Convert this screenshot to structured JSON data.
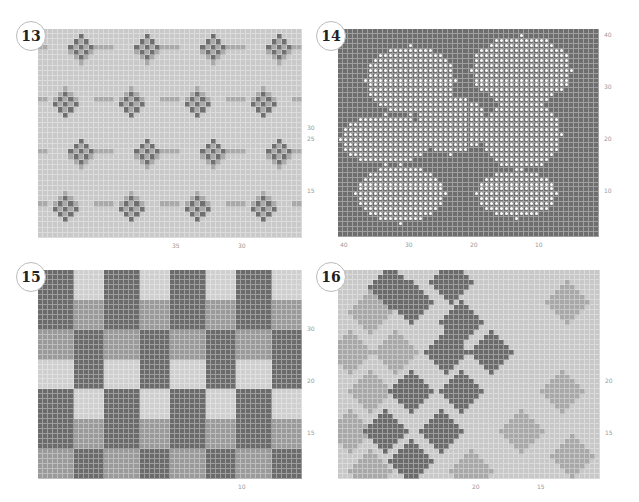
{
  "panels": [
    {
      "id": "13",
      "x": 38,
      "y": 29,
      "w": 264,
      "h": 209,
      "cols": 52,
      "rows": 40,
      "bg": "#c9c9c9",
      "dark": "#6f6f6f",
      "mid": "#a9a9a9",
      "right_labels": [
        {
          "t": "30",
          "y": 124
        },
        {
          "t": "25",
          "y": 135
        },
        {
          "t": "15",
          "y": 187
        }
      ],
      "bottom_labels": [
        {
          "t": "35",
          "x": 172
        },
        {
          "t": "30",
          "x": 238
        }
      ]
    },
    {
      "id": "14",
      "x": 338,
      "y": 29,
      "w": 261,
      "h": 208,
      "cols": 52,
      "rows": 42,
      "bg": "#6e6e6e",
      "right_labels": [
        {
          "t": "40",
          "y": 31
        },
        {
          "t": "30",
          "y": 83
        },
        {
          "t": "20",
          "y": 135
        },
        {
          "t": "10",
          "y": 187
        }
      ],
      "bottom_labels": [
        {
          "t": "40",
          "x": 340
        },
        {
          "t": "30",
          "x": 405
        },
        {
          "t": "20",
          "x": 470
        },
        {
          "t": "10",
          "x": 535
        }
      ]
    },
    {
      "id": "15",
      "x": 38,
      "y": 270,
      "w": 264,
      "h": 209,
      "cols": 52,
      "rows": 42,
      "bg": "#b8b8b8",
      "dark": "#6b6b6b",
      "mid": "#9a9a9a",
      "light": "#cfcfcf",
      "right_labels": [
        {
          "t": "30",
          "y": 325
        },
        {
          "t": "20",
          "y": 377
        },
        {
          "t": "15",
          "y": 429
        }
      ],
      "bottom_labels": [
        {
          "t": "10",
          "x": 238
        }
      ]
    },
    {
      "id": "16",
      "x": 338,
      "y": 270,
      "w": 262,
      "h": 209,
      "cols": 52,
      "rows": 42,
      "bg": "#c8c8c8",
      "dark": "#6b6b6b",
      "mid": "#a8a8a8",
      "right_labels": [
        {
          "t": "20",
          "y": 377
        },
        {
          "t": "15",
          "y": 429
        }
      ],
      "bottom_labels": [
        {
          "t": "20",
          "x": 472
        },
        {
          "t": "15",
          "x": 537
        }
      ]
    }
  ]
}
